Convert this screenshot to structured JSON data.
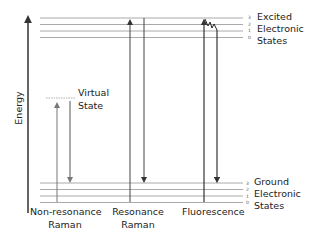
{
  "axis": {
    "label": "Energy"
  },
  "excited": {
    "label_lines": [
      "Excited",
      "Electronic",
      "States"
    ],
    "levels": [
      "3",
      "2",
      "1",
      "0"
    ]
  },
  "ground": {
    "label_lines": [
      "Ground",
      "Electronic",
      "States"
    ],
    "levels": [
      "3",
      "2",
      "1",
      "0"
    ]
  },
  "virtual": {
    "label_lines": [
      "Virtual",
      "State"
    ]
  },
  "processes": [
    {
      "label_lines": [
        "Non-resonance",
        "Raman"
      ]
    },
    {
      "label_lines": [
        "Resonance",
        "Raman"
      ]
    },
    {
      "label_lines": [
        "Fluorescence"
      ]
    }
  ],
  "colors": {
    "level_line": "#aaaaaa",
    "arrow": "#333333",
    "virtual_line": "#999999"
  }
}
